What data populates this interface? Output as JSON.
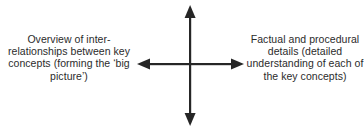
{
  "diagram": {
    "type": "bidirectional-cross-arrow-continuum",
    "background_color": "#ffffff",
    "text_color": "#2b2b2b",
    "arrow_color": "#262626",
    "left_label": "Overview of inter-relationships between key concepts (forming the ‘big picture’)",
    "right_label": "Factual and procedural details (detailed understanding of each of the key concepts)",
    "arrows": {
      "horizontal": {
        "name": "horizontal-double-arrow",
        "double_headed": true,
        "x_start": 7,
        "x_end": 114,
        "y": 64
      },
      "vertical": {
        "name": "vertical-double-arrow",
        "double_headed": true,
        "y_start": 5,
        "y_end": 126,
        "x": 60
      },
      "shaft_width": 2,
      "head_length": 13,
      "head_width": 9
    }
  }
}
